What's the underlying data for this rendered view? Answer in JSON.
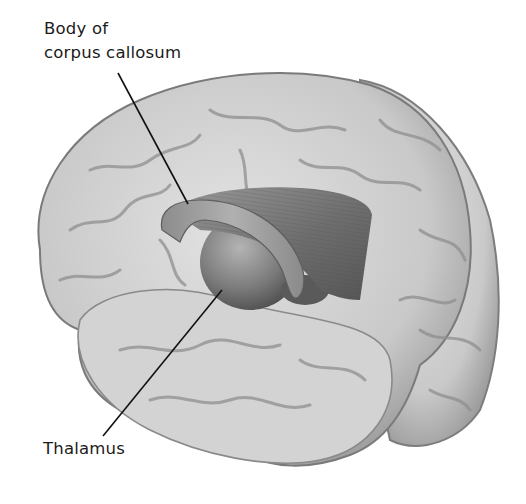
{
  "figure": {
    "background_color": "#ffffff",
    "brain_fill": "#cfcfcf",
    "brain_shadow": "#8a8a8a",
    "structure_fill": "#7a7a7a",
    "line_color": "#111111"
  },
  "labels": {
    "corpus_callosum": {
      "line1": "Body of",
      "line2": "corpus callosum"
    },
    "thalamus": {
      "text": "Thalamus"
    }
  },
  "structures": [
    {
      "name": "Body of corpus callosum",
      "type": "curved band"
    },
    {
      "name": "Thalamus",
      "type": "ovoid"
    }
  ]
}
